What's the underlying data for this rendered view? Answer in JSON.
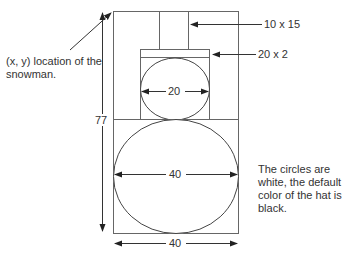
{
  "diagram": {
    "annotations": {
      "location": [
        "(x, y) location of the",
        "snowman."
      ],
      "hat_stem": "10 x 15",
      "hat_brim": "20 x 2",
      "note": [
        "The circles are",
        "white, the default",
        "color of the hat is",
        "black."
      ]
    },
    "dimensions": {
      "height": "77",
      "head_width": "20",
      "body_width": "40",
      "box_width": "40"
    },
    "colors": {
      "line": "#555555",
      "arrow": "#222222"
    }
  }
}
